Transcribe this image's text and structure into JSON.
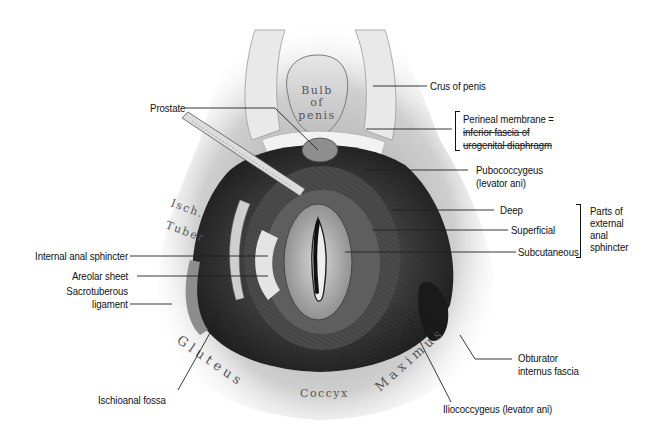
{
  "figure": {
    "inscriptions": {
      "bulb_line1": "Bulb",
      "bulb_line2": "of",
      "bulb_line3": "penis",
      "isch_line1": "Isch.",
      "isch_line2": "Tuber",
      "gluteus": "Gluteus",
      "coccyx": "Coccyx",
      "maximus": "Maximus"
    },
    "labels": {
      "crus_of_penis": "Crus of penis",
      "prostate": "Prostate",
      "perineal_membrane_line1": "Perineal membrane =",
      "perineal_membrane_line2": "inferior fascia of",
      "perineal_membrane_line3": "urogenital diaphragm",
      "pubococcygeus_line1": "Pubococcygeus",
      "pubococcygeus_line2": "(levator ani)",
      "deep": "Deep",
      "superficial": "Superficial",
      "subcutaneous": "Subcutaneous",
      "external_anal_sphincter_line1": "Parts of",
      "external_anal_sphincter_line2": "external",
      "external_anal_sphincter_line3": "anal",
      "external_anal_sphincter_line4": "sphincter",
      "internal_anal_sphincter": "Internal anal sphincter",
      "areolar_sheet": "Areolar sheet",
      "sacrotuberous_line1": "Sacrotuberous",
      "sacrotuberous_line2": "ligament",
      "obturator_line1": "Obturator",
      "obturator_line2": "internus fascia",
      "ischioanal_fossa": "Ischioanal fossa",
      "iliococcygeus": "Iliococcygeus (levator ani)"
    },
    "colors": {
      "ink": "#111111",
      "muscle_dark": "#2a2a2a",
      "muscle_mid": "#6b6b6b",
      "tissue_light": "#d9d9d9",
      "background": "#ffffff"
    }
  }
}
